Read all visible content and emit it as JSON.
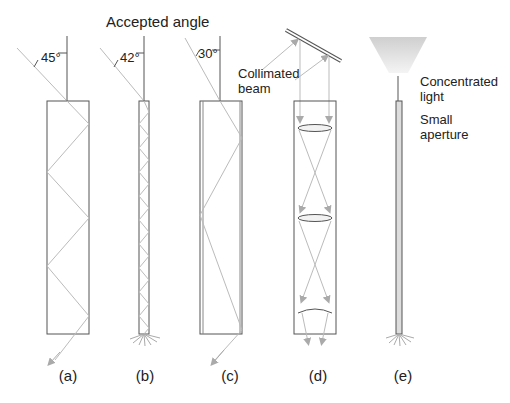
{
  "title": "Accepted angle",
  "panels": [
    {
      "id": "a",
      "caption": "(a)",
      "angle_label": "45°"
    },
    {
      "id": "b",
      "caption": "(b)",
      "angle_label": "42°"
    },
    {
      "id": "c",
      "caption": "(c)",
      "angle_label": "30°"
    },
    {
      "id": "d",
      "caption": "(d)",
      "annotation": [
        "Collimated",
        "beam"
      ]
    },
    {
      "id": "e",
      "caption": "(e)",
      "annotation_top": [
        "Concentrated",
        "light"
      ],
      "annotation_bottom": [
        "Small",
        "aperture"
      ]
    }
  ],
  "colors": {
    "outline": "#555555",
    "ray": "#bbbbbb",
    "fill": "#dddddd"
  }
}
